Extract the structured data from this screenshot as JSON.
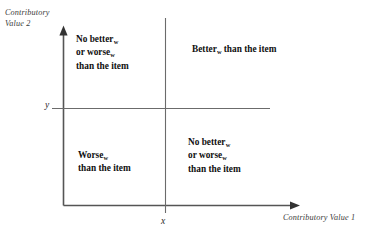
{
  "figure": {
    "background_color": "#ffffff",
    "line_color": "#555555",
    "text_color": "#101010"
  },
  "axes": {
    "y_axis_title": "Contributory\nValue 2",
    "x_axis_title": "Contributory Value 1",
    "y_tick_label": "y",
    "x_tick_label": "x"
  },
  "quadrants": {
    "top_left": {
      "line1_main": "No better",
      "line1_sub": "w",
      "line2_main": "or worse",
      "line2_sub": "w",
      "line3": "than the item"
    },
    "top_right": {
      "line1_main": "Better",
      "line1_sub": "w",
      "line1_tail": " than the item"
    },
    "bottom_left": {
      "line1_main": "Worse",
      "line1_sub": "w",
      "line2": "than the item"
    },
    "bottom_right": {
      "line1_main": "No better",
      "line1_sub": "w",
      "line2_main": "or worse",
      "line2_sub": "w",
      "line3": "than the item"
    }
  }
}
